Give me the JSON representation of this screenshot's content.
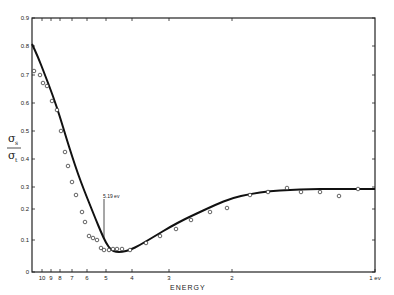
{
  "chart_data": {
    "type": "line",
    "title": "",
    "xlabel": "ENERGY",
    "ylabel": "σs / σt",
    "ylabel_numerator": "σ",
    "ylabel_numerator_sub": "s",
    "ylabel_denominator": "σ",
    "ylabel_denominator_sub": "t",
    "x_reversed": true,
    "x_scale": "nonlinear (energy decreasing to the right)",
    "x_ticks": [
      "10",
      "9",
      "8",
      "7",
      "6",
      "5",
      "4",
      "3",
      "2",
      "1 ev"
    ],
    "y_ticks": [
      "0",
      "0.1",
      "0.2",
      "0.3",
      "0.4",
      "0.5",
      "0.6",
      "0.7",
      "0.8",
      "0.9"
    ],
    "ylim": [
      0,
      0.9
    ],
    "grid": false,
    "legend": null,
    "annotations": [
      {
        "text": "5.19 ev",
        "x": 5.19,
        "y": 0.13
      }
    ],
    "series": [
      {
        "name": "fitted curve",
        "style": "solid-line",
        "x": [
          11,
          10,
          9,
          8,
          7,
          6,
          5.5,
          5.19,
          5,
          4.7,
          4.4,
          4,
          3.5,
          3,
          2.5,
          2,
          1.6,
          1.3,
          1.1,
          1
        ],
        "y": [
          0.81,
          0.76,
          0.68,
          0.59,
          0.47,
          0.3,
          0.2,
          0.13,
          0.1,
          0.075,
          0.08,
          0.095,
          0.13,
          0.175,
          0.22,
          0.255,
          0.275,
          0.287,
          0.293,
          0.295
        ]
      },
      {
        "name": "measured",
        "style": "open-circle",
        "x": [
          10.8,
          10.2,
          9.6,
          9.1,
          8.6,
          8.2,
          7.8,
          7.3,
          6.9,
          6.5,
          6.2,
          5.8,
          5.5,
          5.3,
          5.1,
          5.0,
          4.8,
          4.6,
          4.45,
          4.3,
          4.15,
          4.0,
          3.7,
          3.3,
          2.9,
          2.55,
          2.2,
          1.9,
          1.65,
          1.45,
          1.3,
          1.15
        ],
        "y": [
          0.715,
          0.7,
          0.68,
          0.66,
          0.6,
          0.565,
          0.49,
          0.42,
          0.375,
          0.32,
          0.275,
          0.22,
          0.18,
          0.135,
          0.12,
          0.1,
          0.08,
          0.075,
          0.08,
          0.083,
          0.085,
          0.085,
          0.095,
          0.13,
          0.155,
          0.195,
          0.215,
          0.245,
          0.26,
          0.28,
          0.275,
          0.29
        ]
      }
    ]
  },
  "render": {
    "axis_color": "#222222",
    "curve_color": "#111111",
    "frame": {
      "left": 32,
      "right": 375,
      "top": 18,
      "bottom": 272
    },
    "x_tick_px": [
      42,
      51,
      60,
      72,
      87,
      106,
      132,
      169,
      232,
      375
    ],
    "y_tick_px": [
      272,
      240,
      209,
      187,
      159,
      131,
      103,
      75,
      46,
      18
    ],
    "curve_px": [
      [
        32,
        44
      ],
      [
        38,
        57
      ],
      [
        45,
        75
      ],
      [
        53,
        96
      ],
      [
        60,
        117
      ],
      [
        66,
        137
      ],
      [
        72,
        156
      ],
      [
        78,
        174
      ],
      [
        84,
        190
      ],
      [
        90,
        205
      ],
      [
        96,
        220
      ],
      [
        101,
        232
      ],
      [
        106,
        243
      ],
      [
        111,
        250
      ],
      [
        116,
        252
      ],
      [
        122,
        252
      ],
      [
        130,
        250
      ],
      [
        140,
        245
      ],
      [
        155,
        236
      ],
      [
        170,
        227
      ],
      [
        185,
        219
      ],
      [
        200,
        212
      ],
      [
        215,
        205
      ],
      [
        232,
        198
      ],
      [
        250,
        194
      ],
      [
        270,
        191
      ],
      [
        290,
        190
      ],
      [
        310,
        189
      ],
      [
        330,
        189
      ],
      [
        350,
        189
      ],
      [
        375,
        189
      ]
    ],
    "points_px": [
      [
        34,
        71
      ],
      [
        40,
        75
      ],
      [
        43,
        83
      ],
      [
        47,
        86
      ],
      [
        52,
        101
      ],
      [
        57,
        110
      ],
      [
        61,
        131
      ],
      [
        65,
        152
      ],
      [
        68,
        166
      ],
      [
        72,
        182
      ],
      [
        76,
        195
      ],
      [
        82,
        212
      ],
      [
        85,
        222
      ],
      [
        89,
        236
      ],
      [
        93,
        238
      ],
      [
        97,
        240
      ],
      [
        101,
        248
      ],
      [
        104,
        250
      ],
      [
        109,
        250
      ],
      [
        113,
        249
      ],
      [
        117,
        249
      ],
      [
        122,
        249
      ],
      [
        130,
        250
      ],
      [
        146,
        243
      ],
      [
        160,
        236
      ],
      [
        176,
        229
      ],
      [
        191,
        220
      ],
      [
        210,
        212
      ],
      [
        227,
        208
      ],
      [
        250,
        195
      ],
      [
        268,
        192
      ],
      [
        287,
        188
      ]
    ],
    "points_px_right": [
      [
        301,
        192
      ],
      [
        320,
        192
      ],
      [
        339,
        196
      ],
      [
        358,
        189
      ]
    ],
    "annot_px": {
      "x": 104,
      "text_y": 198,
      "line_top": 199,
      "line_bottom": 238
    }
  }
}
